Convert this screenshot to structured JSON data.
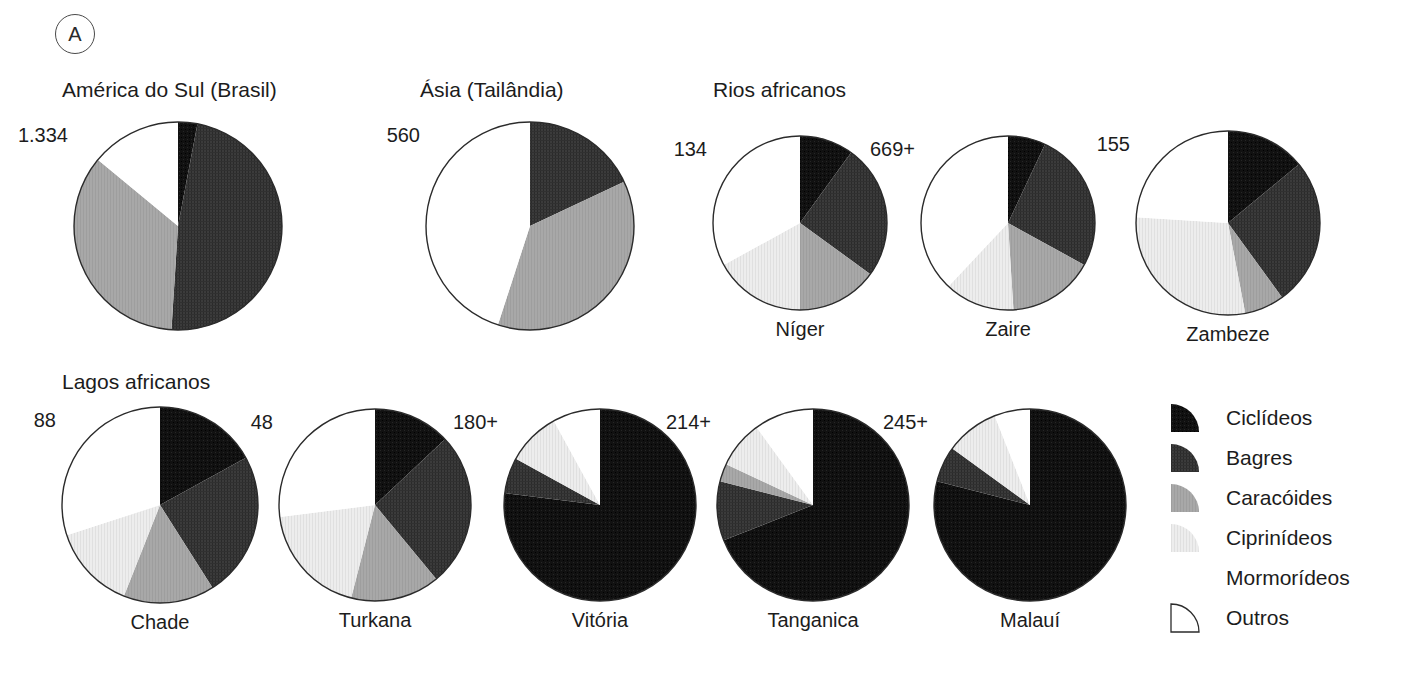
{
  "panel": {
    "marker": "A"
  },
  "legend": {
    "items": [
      {
        "label": "Ciclídeos",
        "key": "ciclideos",
        "color": "#101010",
        "swatch": true
      },
      {
        "label": "Bagres",
        "key": "bagres",
        "color": "#3a3a3a",
        "swatch": true
      },
      {
        "label": "Caracóides",
        "key": "caracoides",
        "color": "#a6a6a6",
        "swatch": true
      },
      {
        "label": "Ciprinídeos",
        "key": "ciprinideos",
        "color": "#ececec",
        "swatch": true
      },
      {
        "label": "Mormorídeos",
        "key": "mormorideos",
        "color": "#ffffff",
        "swatch": false
      },
      {
        "label": "Outros",
        "key": "outros",
        "color": "#ffffff",
        "swatch": true
      }
    ]
  },
  "groups": [
    {
      "title": "América do Sul (Brasil)",
      "x": 62,
      "y": 78
    },
    {
      "title": "Ásia (Tailândia)",
      "x": 420,
      "y": 78
    },
    {
      "title": "Rios africanos",
      "x": 713,
      "y": 78
    },
    {
      "title": "Lagos africanos",
      "x": 62,
      "y": 370
    }
  ],
  "chart_data": {
    "type": "pie",
    "categories": [
      "Ciclídeos",
      "Bagres",
      "Caracóides",
      "Ciprinídeos",
      "Mormorídeos",
      "Outros"
    ],
    "colors": [
      "#101010",
      "#3a3a3a",
      "#a6a6a6",
      "#ececec",
      "#ffffff",
      "#ffffff"
    ],
    "units": "percent of species",
    "note": "Values next to each pie are total species counts; '+' indicates a minimum estimate.",
    "charts": [
      {
        "name": "América do Sul (Brasil)",
        "label": "",
        "value": "1.334",
        "group": "América do Sul (Brasil)",
        "cx": 178,
        "cy": 226,
        "r": 104,
        "values": [
          3,
          48,
          35,
          0,
          0,
          14
        ]
      },
      {
        "name": "Ásia (Tailândia)",
        "label": "",
        "value": "560",
        "group": "Ásia (Tailândia)",
        "cx": 530,
        "cy": 226,
        "r": 104,
        "values": [
          0,
          18,
          37,
          0,
          0,
          45
        ]
      },
      {
        "name": "Níger",
        "label": "Níger",
        "value": "134",
        "group": "Rios africanos",
        "cx": 800,
        "cy": 223,
        "r": 87,
        "values": [
          10,
          25,
          15,
          17,
          0,
          33
        ]
      },
      {
        "name": "Zaire",
        "label": "Zaire",
        "value": "669+",
        "group": "Rios africanos",
        "cx": 1008,
        "cy": 223,
        "r": 87,
        "values": [
          7,
          26,
          16,
          13,
          0,
          38
        ]
      },
      {
        "name": "Zambeze",
        "label": "Zambeze",
        "value": "155",
        "group": "Rios africanos",
        "cx": 1228,
        "cy": 223,
        "r": 92,
        "values": [
          14,
          26,
          7,
          29,
          0,
          24
        ]
      },
      {
        "name": "Chade",
        "label": "Chade",
        "value": "88",
        "group": "Lagos africanos",
        "cx": 160,
        "cy": 505,
        "r": 98,
        "values": [
          17,
          24,
          15,
          14,
          0,
          30
        ]
      },
      {
        "name": "Turkana",
        "label": "Turkana",
        "value": "48",
        "group": "Lagos africanos",
        "cx": 375,
        "cy": 505,
        "r": 96,
        "values": [
          13,
          26,
          15,
          19,
          0,
          27
        ]
      },
      {
        "name": "Vitória",
        "label": "Vitória",
        "value": "180+",
        "group": "Lagos africanos",
        "cx": 600,
        "cy": 505,
        "r": 96,
        "values": [
          77,
          6,
          0,
          9,
          0,
          8
        ]
      },
      {
        "name": "Tanganica",
        "label": "Tanganica",
        "value": "214+",
        "group": "Lagos africanos",
        "cx": 813,
        "cy": 505,
        "r": 96,
        "values": [
          69,
          10,
          3,
          8,
          0,
          10
        ]
      },
      {
        "name": "Malauí",
        "label": "Malauí",
        "value": "245+",
        "group": "Lagos africanos",
        "cx": 1030,
        "cy": 505,
        "r": 96,
        "values": [
          79,
          6,
          0,
          9,
          0,
          6
        ]
      }
    ]
  }
}
